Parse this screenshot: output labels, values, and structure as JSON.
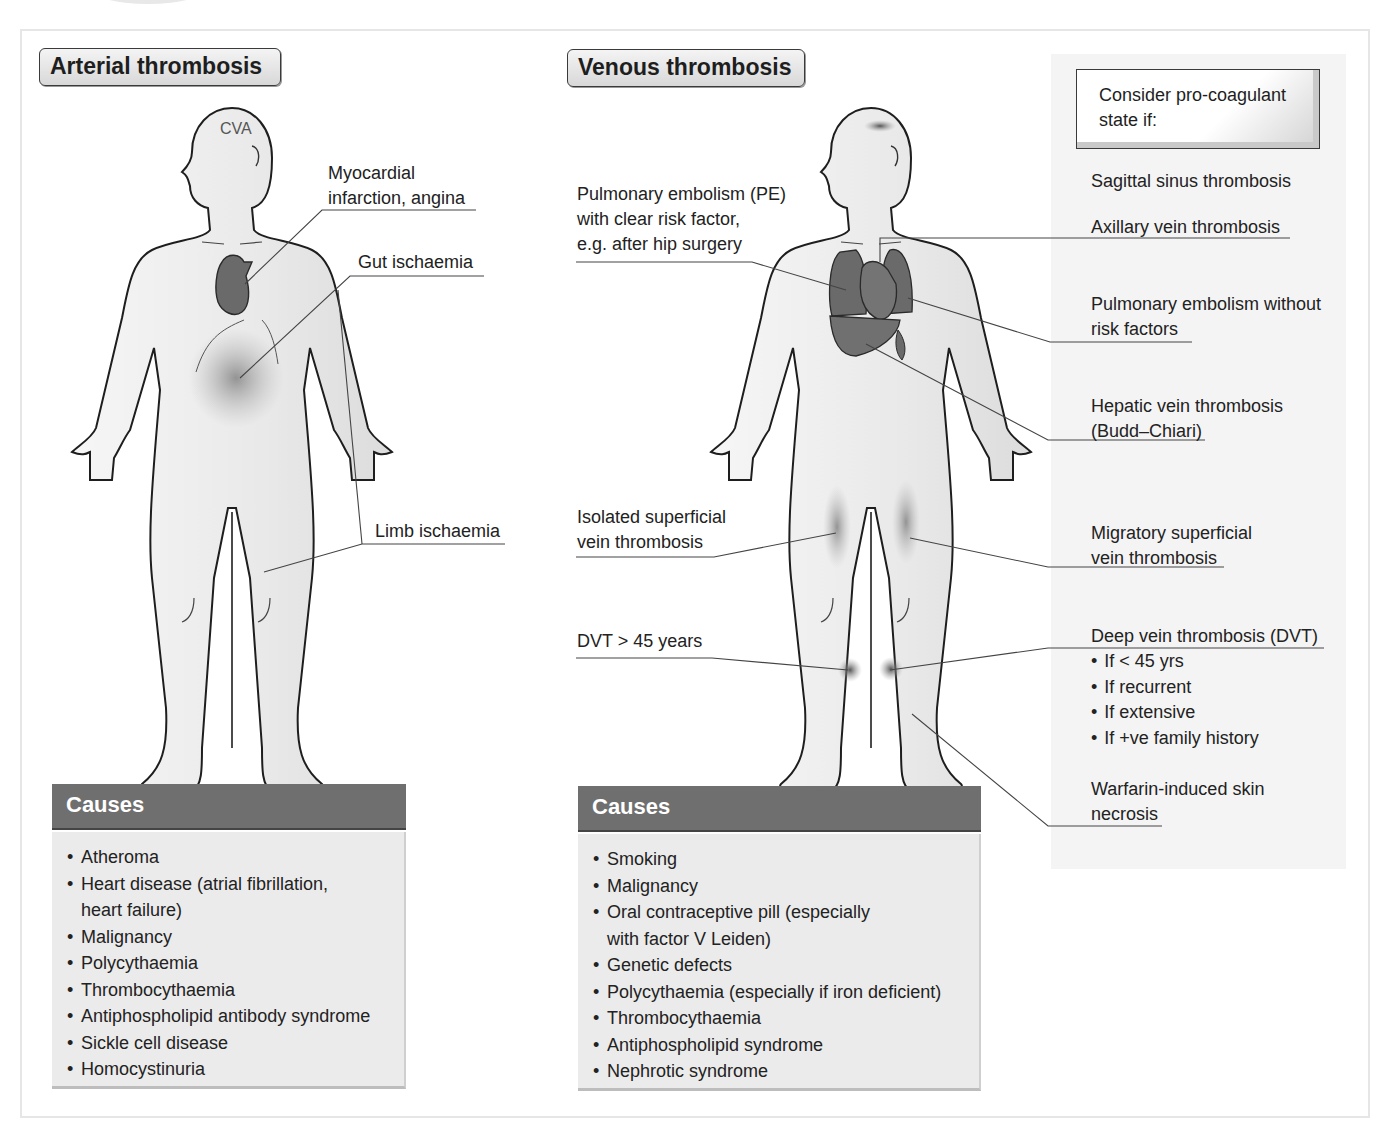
{
  "arterial": {
    "title": "Arterial thrombosis",
    "head_label": "CVA",
    "labels": {
      "mi": [
        "Myocardial",
        "infarction, angina"
      ],
      "gut": "Gut ischaemia",
      "limb": "Limb ischaemia"
    },
    "causes": {
      "heading": "Causes",
      "items": [
        "Atheroma",
        "Heart disease (atrial fibrillation, heart failure)",
        "Malignancy",
        "Polycythaemia",
        "Thrombocythaemia",
        "Antiphospholipid antibody syndrome",
        "Sickle cell disease",
        "Homocystinuria"
      ]
    }
  },
  "venous": {
    "title": "Venous thrombosis",
    "labels": {
      "pe_risk": [
        "Pulmonary embolism (PE)",
        "with clear risk factor,",
        "e.g. after hip surgery"
      ],
      "isolated_svt": [
        "Isolated superficial",
        "vein thrombosis"
      ],
      "dvt_over45": "DVT > 45 years"
    },
    "causes": {
      "heading": "Causes",
      "items": [
        "Smoking",
        "Malignancy",
        "Oral contraceptive pill (especially with factor V Leiden)",
        "Genetic defects",
        "Polycythaemia (especially if iron deficient)",
        "Thrombocythaemia",
        "Antiphospholipid syndrome",
        "Nephrotic syndrome"
      ]
    }
  },
  "procoagulant": {
    "box": [
      "Consider pro-coagulant",
      "state if:"
    ],
    "sagittal": "Sagittal sinus thrombosis",
    "axillary": "Axillary vein thrombosis",
    "pe_no_risk": [
      "Pulmonary embolism without",
      "risk factors"
    ],
    "hepatic": [
      "Hepatic vein thrombosis",
      "(Budd–Chiari)"
    ],
    "migratory": [
      "Migratory superficial",
      "vein thrombosis"
    ],
    "dvt": {
      "title": "Deep vein thrombosis (DVT)",
      "items": [
        "If < 45 yrs",
        "If recurrent",
        "If extensive",
        "If +ve family history"
      ]
    },
    "warfarin": [
      "Warfarin-induced skin",
      "necrosis"
    ]
  },
  "colors": {
    "causes_header": "#6f6f6f",
    "causes_body": "#ebebeb",
    "organ": "#6a6a6a",
    "body_fill": "#ececec",
    "side_panel": "#f4f4f4"
  }
}
